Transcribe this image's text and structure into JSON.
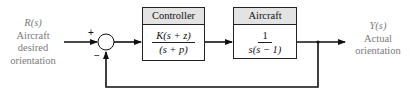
{
  "input": {
    "symbol": "R(s)",
    "line1": "Aircraft",
    "line2": "desired",
    "line3": "orientation"
  },
  "output": {
    "symbol": "Y(s)",
    "line1": "Actual",
    "line2": "orientation"
  },
  "summing_junction": {
    "plus": "+",
    "minus": "−"
  },
  "controller": {
    "title": "Controller",
    "numerator": "K(s + z)",
    "denominator": "(s + p)"
  },
  "plant": {
    "title": "Aircraft",
    "numerator": "1",
    "denominator": "s(s − 1)"
  },
  "colors": {
    "line": "#111111",
    "header_bg": "#e3e3e3",
    "label_text": "#7a7a7a"
  }
}
